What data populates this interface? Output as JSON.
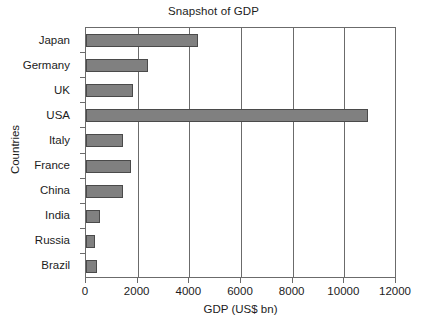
{
  "chart_data": {
    "type": "bar",
    "orientation": "horizontal",
    "title": "Snapshot of GDP",
    "xlabel": "GDP (US$ bn)",
    "ylabel": "Countries",
    "categories": [
      "Japan",
      "Germany",
      "UK",
      "USA",
      "Italy",
      "France",
      "China",
      "India",
      "Russia",
      "Brazil"
    ],
    "values": [
      4350,
      2400,
      1800,
      10900,
      1450,
      1750,
      1420,
      550,
      350,
      430
    ],
    "xlim": [
      0,
      12000
    ],
    "xticks": [
      0,
      2000,
      4000,
      6000,
      8000,
      10000,
      12000
    ],
    "xtick_labels": [
      "0",
      "2000",
      "4000",
      "6000",
      "8000",
      "10000",
      "12000"
    ],
    "grid": "vertical",
    "legend": null,
    "series": [
      {
        "name": "GDP (US$ bn)",
        "values": [
          4350,
          2400,
          1800,
          10900,
          1450,
          1750,
          1420,
          550,
          350,
          430
        ]
      }
    ],
    "bar_color": "#808080",
    "bar_edge_color": "#4a4a4a",
    "axis_color": "#6b6b6b",
    "background_color": "#ffffff"
  }
}
